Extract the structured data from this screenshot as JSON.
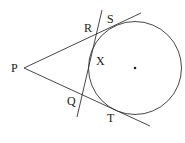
{
  "diagram": {
    "labels": {
      "P": "P",
      "R": "R",
      "S": "S",
      "X": "X",
      "Q": "Q",
      "T": "T"
    },
    "colors": {
      "stroke": "#333333",
      "text": "#222222",
      "background": "#ffffff"
    }
  }
}
